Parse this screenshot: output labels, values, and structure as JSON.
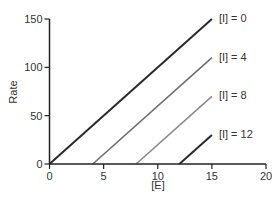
{
  "chart_data": {
    "type": "line",
    "title": "",
    "xlabel": "[E]",
    "ylabel": "Rate",
    "xlim": [
      0,
      20
    ],
    "ylim": [
      0,
      150
    ],
    "xticks": [
      0,
      5,
      10,
      15,
      20
    ],
    "yticks": [
      0,
      50,
      100,
      150
    ],
    "grid": false,
    "legend_position": "inline-right-of-line-ends",
    "series": [
      {
        "name": "[I] = 0",
        "label": "[I] = 0",
        "color": "#2a2a2a",
        "width": 2.0,
        "points": [
          [
            0,
            0
          ],
          [
            15,
            150
          ]
        ]
      },
      {
        "name": "[I] = 4",
        "label": "[I] = 4",
        "color": "#6e6e6e",
        "width": 1.6,
        "points": [
          [
            4,
            0
          ],
          [
            15,
            110
          ]
        ]
      },
      {
        "name": "[I] = 8",
        "label": "[I] = 8",
        "color": "#8a8a8a",
        "width": 1.6,
        "points": [
          [
            8,
            0
          ],
          [
            15,
            70
          ]
        ]
      },
      {
        "name": "[I] = 12",
        "label": "[I] = 12",
        "color": "#2a2a2a",
        "width": 2.0,
        "points": [
          [
            12,
            0
          ],
          [
            15,
            30
          ]
        ]
      }
    ]
  },
  "colors": {
    "axis": "#222222",
    "text": "#333333",
    "background": "#ffffff"
  }
}
